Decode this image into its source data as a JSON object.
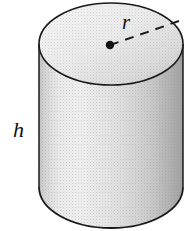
{
  "figure": {
    "kind": "geometry-diagram",
    "shape_name": "cylinder",
    "background_color": "#ffffff",
    "outline_color": "#1a1a1a",
    "width_px": 192,
    "height_px": 231
  },
  "labels": {
    "radius": "r",
    "height": "h"
  },
  "annotations": {
    "radius_marker": "center-dot",
    "radius_line_style": "dashed",
    "height_marker": "side-label"
  },
  "geometry": {
    "top_ellipse": {
      "cx": 111,
      "cy": 44,
      "rx": 72,
      "ry": 41
    },
    "bottom_ellipse": {
      "cx": 111,
      "cy": 187,
      "rx": 72,
      "ry": 41
    },
    "body": {
      "left_x": 39,
      "right_x": 183,
      "top_y": 44,
      "bottom_y": 187
    },
    "center_dot": {
      "cx": 110,
      "cy": 45,
      "r": 4
    },
    "radius_line": {
      "x1": 110,
      "y1": 45,
      "x2": 179,
      "y2": 21
    }
  },
  "colors": {
    "top_face_light": "#f4f4f4",
    "top_face_mid": "#e2e2e2",
    "top_face_dark": "#cfcfcf",
    "body_light": "#f2f2f2",
    "body_mid": "#d8d8d8",
    "body_dark": "#a9a9a9",
    "outline": "#1a1a1a",
    "label": "#111111"
  }
}
